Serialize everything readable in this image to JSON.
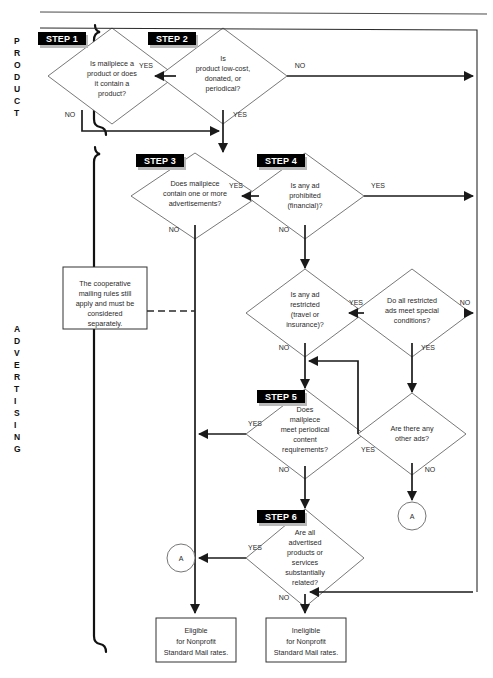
{
  "document": {
    "title": "Nonprofit Standard Mail Eligibility Flowchart",
    "top_rule": true
  },
  "sections": [
    {
      "id": "product",
      "label": "PRODUCT"
    },
    {
      "id": "advertising",
      "label": "ADVERTISING"
    }
  ],
  "steps": [
    {
      "id": "step1",
      "badge": "STEP 1",
      "text": "Is mailpiece a product or does it contain a product?"
    },
    {
      "id": "step2",
      "badge": "STEP 2",
      "text": "Is product low-cost, donated, or periodical?"
    },
    {
      "id": "step3",
      "badge": "STEP 3",
      "text": "Does mailpiece contain one or more advertisements?"
    },
    {
      "id": "step4",
      "badge": "STEP 4",
      "text": "Is any ad prohibited (financial)?"
    },
    {
      "id": "step5",
      "badge": "STEP 5",
      "text": "Does mailpiece meet periodical content requirements?"
    },
    {
      "id": "step6",
      "badge": "STEP 6",
      "text": "Are all advertised products or services substantially related?"
    }
  ],
  "decisions": [
    {
      "id": "restricted",
      "text": "Is any ad restricted (travel or insurance)?"
    },
    {
      "id": "special",
      "text": "Do all restricted ads meet special conditions?"
    },
    {
      "id": "otherads",
      "text": "Are there any other ads?"
    }
  ],
  "notes": [
    {
      "id": "coop",
      "text": "The cooperative mailing rules still apply and must be considered separately."
    }
  ],
  "terminals": [
    {
      "id": "eligible",
      "text": "Eligible for Nonprofit Standard Mail rates."
    },
    {
      "id": "ineligible",
      "text": "Ineligible for Nonprofit Standard Mail rates."
    }
  ],
  "connectors": [
    {
      "id": "a-left",
      "label": "A"
    },
    {
      "id": "a-right",
      "label": "A"
    }
  ],
  "edge_labels": {
    "step1_yes": "YES",
    "step1_no": "NO",
    "step2_no": "NO",
    "step2_yes": "YES",
    "step3_yes": "YES",
    "step3_no": "NO",
    "step4_yes": "YES",
    "step4_no": "NO",
    "restricted_yes": "YES",
    "restricted_no": "NO",
    "special_no": "NO",
    "special_yes": "YES",
    "otherads_yes": "YES",
    "otherads_no": "NO",
    "step5_yes": "YES",
    "step5_no": "NO",
    "step6_yes": "YES",
    "step6_no": "NO"
  },
  "colors": {
    "line": "#1a1a1a",
    "shape_stroke": "#555555",
    "badge_bg": "#000000",
    "badge_fg": "#ffffff",
    "background": "#ffffff"
  }
}
